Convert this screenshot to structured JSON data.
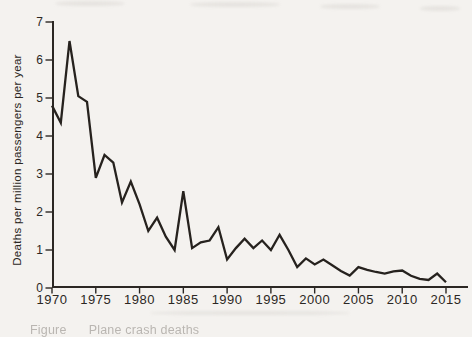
{
  "page": {
    "background_color": "#f4f2ef",
    "caption_fragment": "Figure      Plane crash deaths"
  },
  "chart_data": {
    "type": "line",
    "title": "",
    "xlabel": "",
    "ylabel": "Deaths per million passengers per year",
    "x": [
      1970,
      1971,
      1972,
      1973,
      1974,
      1975,
      1976,
      1977,
      1978,
      1979,
      1980,
      1981,
      1982,
      1983,
      1984,
      1985,
      1986,
      1987,
      1988,
      1989,
      1990,
      1991,
      1992,
      1993,
      1994,
      1995,
      1996,
      1997,
      1998,
      1999,
      2000,
      2001,
      2002,
      2003,
      2004,
      2005,
      2006,
      2007,
      2008,
      2009,
      2010,
      2011,
      2012,
      2013,
      2014,
      2015
    ],
    "values": [
      4.8,
      4.35,
      6.5,
      5.05,
      4.9,
      2.9,
      3.5,
      3.3,
      2.25,
      2.8,
      2.2,
      1.5,
      1.85,
      1.35,
      1.0,
      2.55,
      1.05,
      1.2,
      1.25,
      1.6,
      0.75,
      1.05,
      1.3,
      1.05,
      1.25,
      1.0,
      1.4,
      1.0,
      0.55,
      0.78,
      0.62,
      0.75,
      0.6,
      0.45,
      0.33,
      0.55,
      0.48,
      0.42,
      0.38,
      0.44,
      0.46,
      0.32,
      0.24,
      0.21,
      0.38,
      0.15
    ],
    "xlim": [
      1970,
      2015
    ],
    "ylim": [
      0,
      7
    ],
    "x_ticks": [
      "1970",
      "1975",
      "1980",
      "1985",
      "1990",
      "1995",
      "2000",
      "2005",
      "2010",
      "2015"
    ],
    "y_ticks": [
      "0",
      "1",
      "2",
      "3",
      "4",
      "5",
      "6",
      "7"
    ],
    "grid": false,
    "legend": "none",
    "line_color": "#26221e",
    "axis_color": "#2b2723",
    "tick_label_color": "#2b2723"
  }
}
